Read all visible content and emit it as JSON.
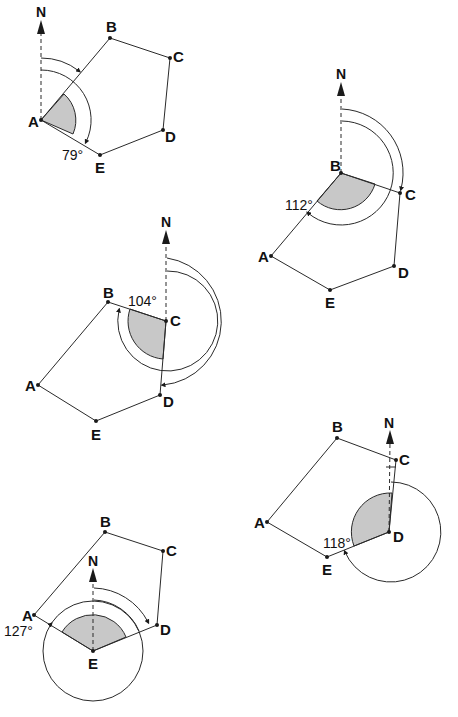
{
  "diagrams": [
    {
      "id": "pentagon-at-A",
      "vertices": {
        "A": "A",
        "B": "B",
        "C": "C",
        "D": "D",
        "E": "E"
      },
      "north": "N",
      "angle": "79°"
    },
    {
      "id": "pentagon-at-B",
      "vertices": {
        "A": "A",
        "B": "B",
        "C": "C",
        "D": "D",
        "E": "E"
      },
      "north": "N",
      "angle": "112°"
    },
    {
      "id": "pentagon-at-C",
      "vertices": {
        "A": "A",
        "B": "B",
        "C": "C",
        "D": "D",
        "E": "E"
      },
      "north": "N",
      "angle": "104°"
    },
    {
      "id": "pentagon-at-D",
      "vertices": {
        "A": "A",
        "B": "B",
        "C": "C",
        "D": "D",
        "E": "E"
      },
      "north": "N",
      "angle": "118°"
    },
    {
      "id": "pentagon-at-E",
      "vertices": {
        "A": "A",
        "B": "B",
        "C": "C",
        "D": "D",
        "E": "E"
      },
      "north": "N",
      "angle": "127°"
    }
  ],
  "colors": {
    "line": "#2a2a2a",
    "shade": "#c8c8c8",
    "background": "#ffffff"
  }
}
